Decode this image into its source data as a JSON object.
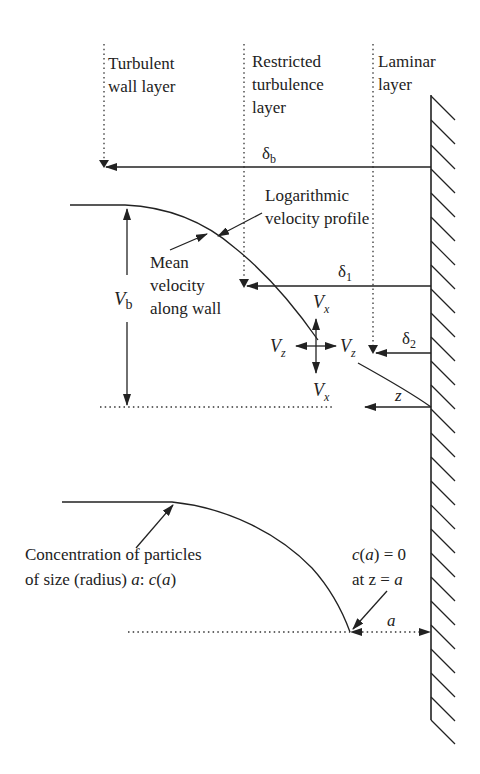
{
  "diagram": {
    "layers": {
      "turbulent": [
        "Turbulent",
        "wall layer"
      ],
      "restricted": [
        "Restricted",
        "turbulence",
        "layer"
      ],
      "laminar": [
        "Laminar",
        "layer"
      ]
    },
    "thicknesses": {
      "delta_b": {
        "symbol": "δ",
        "sub": "b"
      },
      "delta_1": {
        "symbol": "δ",
        "sub": "1"
      },
      "delta_2": {
        "symbol": "δ",
        "sub": "2"
      }
    },
    "velocity_profile_label": [
      "Logarithmic",
      "velocity profile"
    ],
    "mean_velocity_label": [
      "Mean",
      "velocity",
      "along wall"
    ],
    "bulk_velocity": {
      "symbol": "V",
      "sub": "b"
    },
    "components": {
      "vx_top": {
        "symbol": "V",
        "sub": "x"
      },
      "vx_bottom": {
        "symbol": "V",
        "sub": "x"
      },
      "vz_left": {
        "symbol": "V",
        "sub": "z"
      },
      "vz_right": {
        "symbol": "V",
        "sub": "z"
      }
    },
    "distance_label": "z",
    "concentration_label": {
      "line1": "Concentration of particles",
      "line2_prefix": "of size (radius) ",
      "line2_a": "a",
      "line2_colon": ": ",
      "line2_c": "c",
      "line2_paren_open": "(",
      "line2_a2": "a",
      "line2_paren_close": ")"
    },
    "boundary_condition": {
      "line1_c": "c",
      "line1_rest_open": "(",
      "line1_a": "a",
      "line1_rest": ") = 0",
      "line2_prefix": "at z = ",
      "line2_a": "a"
    },
    "radius_label": "a"
  }
}
